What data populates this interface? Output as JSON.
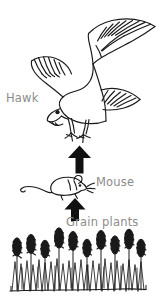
{
  "diagram": {
    "type": "food-chain",
    "style": "hand-drawn black ink line art on white",
    "ink_color": "#1a1a1a",
    "label_color": "#8c8c8c",
    "background_color": "#ffffff",
    "levels": [
      {
        "order": 3,
        "label": "Hawk",
        "role": "secondary consumer",
        "organism_icon": "hawk-bird-icon"
      },
      {
        "order": 2,
        "label": "Mouse",
        "role": "primary consumer",
        "organism_icon": "mouse-rodent-icon"
      },
      {
        "order": 1,
        "label": "Grain plants",
        "role": "producer",
        "organism_icon": "wheat-grain-field-icon"
      }
    ],
    "arrows": [
      {
        "name": "arrow-mouse-to-hawk",
        "direction": "up",
        "from": "Mouse",
        "to": "Hawk",
        "fill": "#111111"
      },
      {
        "name": "arrow-grain-to-mouse",
        "direction": "up",
        "from": "Grain plants",
        "to": "Mouse",
        "fill": "#111111"
      }
    ]
  }
}
